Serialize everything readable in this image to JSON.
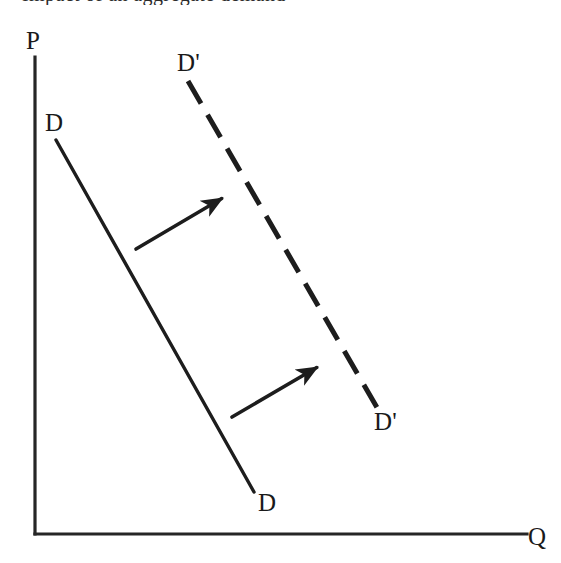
{
  "figure": {
    "background_color": "#ffffff",
    "ink_color": "#1d1d1d",
    "clipped_caption_text": "Impact of an aggregate demand",
    "axes": {
      "y_label": "P",
      "x_label": "Q",
      "origin": {
        "x": 35,
        "y": 534
      },
      "y_top": {
        "x": 35,
        "y": 57
      },
      "x_right": {
        "x": 527,
        "y": 534
      }
    },
    "curves": [
      {
        "name": "original-demand-curve",
        "style": "solid",
        "label_top": "D",
        "label_bottom": "D",
        "start": {
          "x": 56,
          "y": 140
        },
        "end": {
          "x": 254,
          "y": 492
        }
      },
      {
        "name": "shifted-demand-curve",
        "style": "dashed",
        "label_top": "D'",
        "label_bottom": "D'",
        "start": {
          "x": 188,
          "y": 81
        },
        "end": {
          "x": 379,
          "y": 411
        }
      }
    ],
    "shift_arrows": [
      {
        "name": "upper-shift-arrow",
        "tail": {
          "x": 136,
          "y": 249
        },
        "tip": {
          "x": 226,
          "y": 196
        }
      },
      {
        "name": "lower-shift-arrow",
        "tail": {
          "x": 232,
          "y": 417
        },
        "tip": {
          "x": 321,
          "y": 365
        }
      }
    ]
  },
  "chart_data": {
    "type": "line",
    "xlabel": "Q",
    "ylabel": "P",
    "grid": false,
    "legend_position": "inline-curve-labels",
    "annotations": [
      "D",
      "D",
      "D'",
      "D'"
    ],
    "series": [
      {
        "name": "D",
        "style": "solid",
        "label": "D",
        "x": [
          0.05,
          0.45
        ],
        "y": [
          0.83,
          0.09
        ]
      },
      {
        "name": "D'",
        "style": "dashed",
        "label": "D'",
        "x": [
          0.32,
          0.7
        ],
        "y": [
          0.95,
          0.26
        ]
      }
    ],
    "arrows": [
      {
        "name": "shift-arrow-upper",
        "from": [
          0.21,
          0.6
        ],
        "to": [
          0.39,
          0.71
        ]
      },
      {
        "name": "shift-arrow-lower",
        "from": [
          0.4,
          0.25
        ],
        "to": [
          0.58,
          0.35
        ]
      }
    ]
  }
}
